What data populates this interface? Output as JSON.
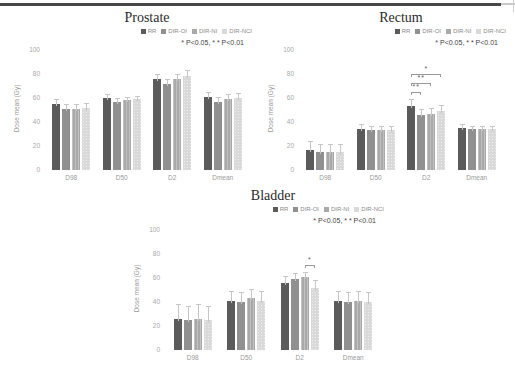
{
  "figure": {
    "top_rule_color": "#474747",
    "background": "#ffffff"
  },
  "shared": {
    "legend": [
      "RR",
      "DIR-OI",
      "DIR-NI",
      "DIR-NCI"
    ],
    "sig_note": "*  P<0.05, * * P<0.01",
    "ylabel": "Dose mean (Gy)",
    "yticks": [
      0,
      20,
      40,
      60,
      80,
      100
    ],
    "ylim": [
      0,
      100
    ],
    "categories": [
      "D98",
      "D50",
      "D2",
      "Dmean"
    ],
    "colors": {
      "series": [
        "#5b5b5b",
        "#909090",
        "#a9a9a9",
        "#d9d9d9"
      ],
      "error_bar": "#c6c6c6",
      "tick_text": "#a8a8a8",
      "title_text": "#2b2b2b"
    }
  },
  "chart_data": [
    {
      "type": "bar",
      "title": "Prostate",
      "xlabel": "",
      "ylabel": "Dose mean (Gy)",
      "ylim": [
        0,
        100
      ],
      "yticks": [
        0,
        20,
        40,
        60,
        80,
        100
      ],
      "grid": false,
      "legend_position": "top-right",
      "categories": [
        "D98",
        "D50",
        "D2",
        "Dmean"
      ],
      "series": [
        {
          "name": "RR",
          "values": [
            55,
            60,
            76,
            61
          ],
          "errors": [
            4,
            3,
            4,
            4
          ]
        },
        {
          "name": "DIR-OI",
          "values": [
            51,
            57,
            72,
            57
          ],
          "errors": [
            4,
            3,
            4,
            4
          ]
        },
        {
          "name": "DIR-NI",
          "values": [
            51,
            58,
            76,
            59
          ],
          "errors": [
            4,
            3,
            4,
            4
          ]
        },
        {
          "name": "DIR-NCI",
          "values": [
            52,
            59,
            78,
            60
          ],
          "errors": [
            4,
            3,
            5,
            4
          ]
        }
      ],
      "significance_brackets": []
    },
    {
      "type": "bar",
      "title": "Rectum",
      "xlabel": "",
      "ylabel": "Dose mean (Gy)",
      "ylim": [
        0,
        100
      ],
      "yticks": [
        0,
        20,
        40,
        60,
        80,
        100
      ],
      "grid": false,
      "legend_position": "top-right",
      "categories": [
        "D98",
        "D50",
        "D2",
        "Dmean"
      ],
      "series": [
        {
          "name": "RR",
          "values": [
            17,
            34,
            53,
            35
          ],
          "errors": [
            7,
            4,
            6,
            3
          ]
        },
        {
          "name": "DIR-OI",
          "values": [
            15,
            33,
            46,
            34
          ],
          "errors": [
            7,
            4,
            5,
            3
          ]
        },
        {
          "name": "DIR-NI",
          "values": [
            15,
            33,
            47,
            34
          ],
          "errors": [
            7,
            4,
            5,
            3
          ]
        },
        {
          "name": "DIR-NCI",
          "values": [
            15,
            33,
            49,
            34
          ],
          "errors": [
            7,
            4,
            5,
            3
          ]
        }
      ],
      "significance_brackets": [
        {
          "category": "D2",
          "from": 0,
          "to": 1,
          "from_series": "RR",
          "to_series": "DIR-OI",
          "label": "**",
          "level": 0
        },
        {
          "category": "D2",
          "from": 0,
          "to": 2,
          "from_series": "RR",
          "to_series": "DIR-NI",
          "label": "**",
          "level": 1
        },
        {
          "category": "D2",
          "from": 0,
          "to": 3,
          "from_series": "RR",
          "to_series": "DIR-NCI",
          "label": "*",
          "level": 2
        }
      ]
    },
    {
      "type": "bar",
      "title": "Bladder",
      "xlabel": "",
      "ylabel": "Dose mean (Gy)",
      "ylim": [
        0,
        100
      ],
      "yticks": [
        0,
        20,
        40,
        60,
        80,
        100
      ],
      "grid": false,
      "legend_position": "top-right",
      "categories": [
        "D98",
        "D50",
        "D2",
        "Dmean"
      ],
      "series": [
        {
          "name": "RR",
          "values": [
            26,
            41,
            56,
            41
          ],
          "errors": [
            12,
            8,
            6,
            8
          ]
        },
        {
          "name": "DIR-OI",
          "values": [
            25,
            40,
            59,
            40
          ],
          "errors": [
            12,
            8,
            5,
            8
          ]
        },
        {
          "name": "DIR-NI",
          "values": [
            26,
            43,
            61,
            41
          ],
          "errors": [
            12,
            8,
            4,
            8
          ]
        },
        {
          "name": "DIR-NCI",
          "values": [
            25,
            41,
            52,
            40
          ],
          "errors": [
            12,
            8,
            6,
            8
          ]
        }
      ],
      "significance_brackets": [
        {
          "category": "D2",
          "from": 2,
          "to": 3,
          "from_series": "DIR-NI",
          "to_series": "DIR-NCI",
          "label": "*",
          "level": 0
        }
      ]
    }
  ]
}
